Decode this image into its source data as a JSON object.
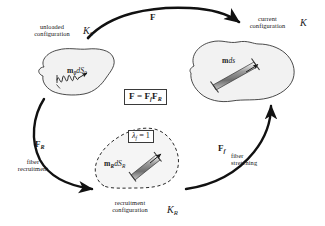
{
  "figure": {
    "background": "#ffffff",
    "blob_fill": "#f2f2f2",
    "blob_stroke": "#2b2b2b",
    "arrow_color": "#111111",
    "fiber_fill": "#8d8d8d"
  },
  "configurations": {
    "unloaded": {
      "caption_line1": "unloaded",
      "caption_line2": "configuration",
      "symbol": "K",
      "symbol_sub": "0",
      "fiber_label_main": "m",
      "fiber_label_sub1": "0",
      "fiber_label_mid": "dS",
      "fiber_label_sub2": "0",
      "fiber_state": "crimped"
    },
    "current": {
      "caption_line1": "current",
      "caption_line2": "configuration",
      "symbol": "K",
      "symbol_sub": "",
      "fiber_label_main": "m",
      "fiber_label_mid": "ds",
      "fiber_state": "stretched"
    },
    "recruitment": {
      "caption_line1": "recruitment",
      "caption_line2": "configuration",
      "symbol": "K",
      "symbol_sub": "R",
      "fiber_label_main": "m",
      "fiber_label_sub1": "R",
      "fiber_label_mid": "dS",
      "fiber_label_sub2": "R",
      "fiber_state": "straight",
      "stretch_box_lambda": "λ",
      "stretch_box_sub": "f",
      "stretch_box_value": "= 1"
    }
  },
  "equation_box": {
    "lhs": "F",
    "eq": "=",
    "rhs_first": "F",
    "rhs_first_sub": "f",
    "rhs_second": "F",
    "rhs_second_sub": "R"
  },
  "arrows": {
    "top": {
      "label": "F",
      "label_sub": "",
      "from": "unloaded",
      "to": "current",
      "description": "total deformation gradient"
    },
    "left": {
      "label": "F",
      "label_sub": "R",
      "caption_line1": "fiber",
      "caption_line2": "recruitment",
      "from": "unloaded",
      "to": "recruitment"
    },
    "right": {
      "label": "F",
      "label_sub": "f",
      "caption_line1": "fiber",
      "caption_line2": "stretching",
      "from": "recruitment",
      "to": "current"
    }
  }
}
